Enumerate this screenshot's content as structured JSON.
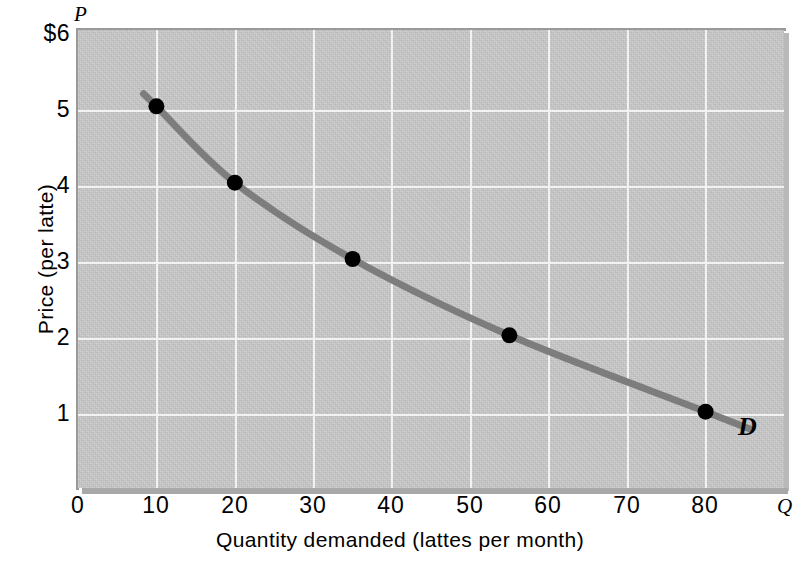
{
  "chart_data": {
    "type": "line",
    "title": "",
    "xlabel": "Quantity demanded (lattes per month)",
    "ylabel": "Price (per latte)",
    "x_axis_symbol": "Q",
    "y_axis_symbol": "P",
    "xlim": [
      0,
      90
    ],
    "ylim": [
      0,
      6
    ],
    "grid": true,
    "legend_position": "inline-right",
    "series": [
      {
        "name": "D",
        "label": "D",
        "points": [
          {
            "x": 10,
            "y": 5
          },
          {
            "x": 20,
            "y": 4
          },
          {
            "x": 35,
            "y": 3
          },
          {
            "x": 55,
            "y": 2
          },
          {
            "x": 80,
            "y": 1
          }
        ]
      }
    ],
    "x_ticks": [
      {
        "value": 0,
        "label": "0"
      },
      {
        "value": 10,
        "label": "10"
      },
      {
        "value": 20,
        "label": "20"
      },
      {
        "value": 30,
        "label": "30"
      },
      {
        "value": 40,
        "label": "40"
      },
      {
        "value": 50,
        "label": "50"
      },
      {
        "value": 60,
        "label": "60"
      },
      {
        "value": 70,
        "label": "70"
      },
      {
        "value": 80,
        "label": "80"
      }
    ],
    "y_ticks": [
      {
        "value": 6,
        "label": "$6"
      },
      {
        "value": 5,
        "label": "5"
      },
      {
        "value": 4,
        "label": "4"
      },
      {
        "value": 3,
        "label": "3"
      },
      {
        "value": 2,
        "label": "2"
      },
      {
        "value": 1,
        "label": "1"
      }
    ],
    "colors": {
      "plot_background": "#c9c9c9",
      "gridline": "#f2f2f2",
      "curve": "#7d7d7d",
      "marker": "#000000",
      "text": "#000000",
      "panel_edge": "#9a9a9a"
    }
  },
  "axes": {
    "y_title": "Price (per latte)",
    "x_title": "Quantity demanded (lattes per month)",
    "p_symbol": "P",
    "q_symbol": "Q"
  },
  "curve": {
    "label": "D"
  },
  "yticks": {
    "t6": "$6",
    "t5": "5",
    "t4": "4",
    "t3": "3",
    "t2": "2",
    "t1": "1"
  },
  "xticks": {
    "t0": "0",
    "t10": "10",
    "t20": "20",
    "t30": "30",
    "t40": "40",
    "t50": "50",
    "t60": "60",
    "t70": "70",
    "t80": "80"
  }
}
